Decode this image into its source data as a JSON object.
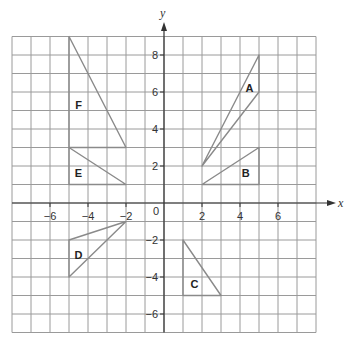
{
  "figure": {
    "type": "coordinate-grid-diagram",
    "x_axis": {
      "label": "x",
      "min": -8,
      "max": 8,
      "tick_labels": [
        -6,
        -4,
        -2,
        2,
        4,
        6
      ]
    },
    "y_axis": {
      "label": "y",
      "min": -7,
      "max": 9,
      "tick_labels": [
        8,
        6,
        4,
        2,
        -2,
        -4,
        -6
      ]
    },
    "origin_label": "0",
    "shapes": [
      {
        "label": "A",
        "vertices": [
          [
            2,
            2
          ],
          [
            5,
            8
          ],
          [
            5,
            6
          ]
        ],
        "label_pos": [
          4.5,
          6.2
        ]
      },
      {
        "label": "B",
        "vertices": [
          [
            2,
            1
          ],
          [
            5,
            3
          ],
          [
            5,
            1
          ]
        ],
        "label_pos": [
          4.3,
          1.6
        ]
      },
      {
        "label": "C",
        "vertices": [
          [
            1,
            -2
          ],
          [
            1,
            -5
          ],
          [
            3,
            -5
          ]
        ],
        "label_pos": [
          1.6,
          -4.4
        ]
      },
      {
        "label": "D",
        "vertices": [
          [
            -2,
            -1
          ],
          [
            -5,
            -2
          ],
          [
            -5,
            -4
          ]
        ],
        "label_pos": [
          -4.5,
          -2.8
        ]
      },
      {
        "label": "E",
        "vertices": [
          [
            -5,
            3
          ],
          [
            -5,
            1
          ],
          [
            -2,
            1
          ]
        ],
        "label_pos": [
          -4.5,
          1.6
        ]
      },
      {
        "label": "F",
        "vertices": [
          [
            -5,
            9
          ],
          [
            -5,
            3
          ],
          [
            -2,
            3
          ]
        ],
        "label_pos": [
          -4.5,
          5.3
        ]
      }
    ],
    "colors": {
      "grid": "#9a9a9a",
      "axis": "#333333",
      "shape_stroke": "#8a8a8a",
      "label": "#222222"
    }
  }
}
